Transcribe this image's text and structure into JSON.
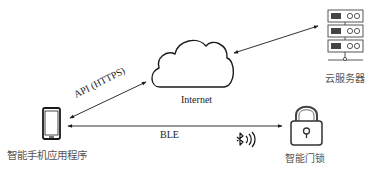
{
  "diagram": {
    "title": "",
    "nodes": {
      "internet": {
        "label": "Internet",
        "icon": "cloud-icon"
      },
      "cloud_server": {
        "label": "云服务器",
        "icon": "server-stack-icon"
      },
      "smartphone_app": {
        "label": "智能手机应用程序",
        "icon": "smartphone-icon"
      },
      "smart_lock": {
        "label": "智能门锁",
        "icon": "padlock-icon"
      }
    },
    "edges": [
      {
        "from": "smartphone_app",
        "to": "internet",
        "label": "API (HTTPS)",
        "direction": "bidirectional"
      },
      {
        "from": "internet",
        "to": "cloud_server",
        "label": "",
        "direction": "bidirectional"
      },
      {
        "from": "smartphone_app",
        "to": "smart_lock",
        "label": "BLE",
        "direction": "bidirectional"
      }
    ],
    "annotations": {
      "bluetooth_icon": "bluetooth-signal-icon"
    },
    "colors": {
      "stroke": "#1a1a1a",
      "label_cn": "#555555",
      "label_en": "#222222",
      "background": "#ffffff"
    }
  }
}
